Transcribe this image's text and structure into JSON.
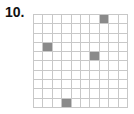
{
  "problem_number": "10.",
  "grid": {
    "rows": 10,
    "cols": 10,
    "line_color": "#c8c8c8",
    "fill_color": "#8a8a8a",
    "shaded_cells": [
      {
        "row": 1,
        "col": 8
      },
      {
        "row": 4,
        "col": 2
      },
      {
        "row": 5,
        "col": 7
      },
      {
        "row": 10,
        "col": 4
      }
    ]
  }
}
